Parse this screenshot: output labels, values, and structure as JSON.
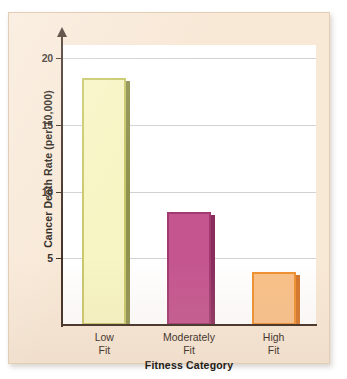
{
  "chart_data": {
    "type": "bar",
    "title": "",
    "xlabel": "Fitness Category",
    "ylabel": "Cancer Death Rate (per 10,000)",
    "categories": [
      "Low Fit",
      "Moderately Fit",
      "High Fit"
    ],
    "category_lines": [
      [
        "Low",
        "Fit"
      ],
      [
        "Moderately",
        "Fit"
      ],
      [
        "High",
        "Fit"
      ]
    ],
    "values": [
      18.5,
      8.5,
      4.0
    ],
    "ylim": [
      0,
      21
    ],
    "yticks": [
      5,
      10,
      15,
      20
    ],
    "ytick_labels": [
      "5",
      "10",
      "15",
      "20"
    ],
    "grid": true,
    "grid_axis": "y",
    "legend": null,
    "bar_colors": [
      "#f7f5c3",
      "#c4558f",
      "#f8c088"
    ],
    "bar_border_colors": [
      "#c9c86a",
      "#a13a70",
      "#ef9030"
    ],
    "bar_shadow_colors": [
      "#8f9150",
      "#8a2d5d",
      "#d3752a"
    ]
  },
  "figure": {
    "background_color": "#f8e8d6",
    "plot_background_color": "#ffffff",
    "axis_color": "#3d2b20",
    "gridline_color": "#d2d2d2"
  }
}
